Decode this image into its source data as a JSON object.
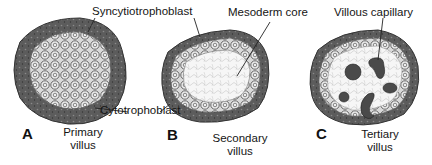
{
  "figure": {
    "panels": [
      {
        "letter": "A",
        "caption_line1": "Primary",
        "caption_line2": "villus"
      },
      {
        "letter": "B",
        "caption_line1": "Secondary",
        "caption_line2": "villus"
      },
      {
        "letter": "C",
        "caption_line1": "Tertiary",
        "caption_line2": "villus"
      }
    ],
    "labels": {
      "syncytiotrophoblast": "Syncytiotrophoblast",
      "cytotrophoblast": "Cytotrophoblast",
      "mesoderm_core": "Mesoderm core",
      "villous_capillary": "Villous capillary"
    },
    "colors": {
      "syncytium": "#5a5a5a",
      "cytotrophoblast_fill": "#d8d8d8",
      "core_fill": "#f4f4f4",
      "capillary": "#4a4a4a"
    }
  }
}
